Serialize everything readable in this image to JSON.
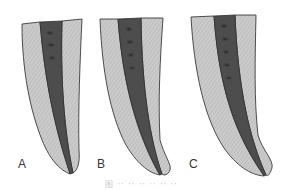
{
  "figure": {
    "panels": [
      {
        "label": "A",
        "description": "tooth root cross-section with canal"
      },
      {
        "label": "B",
        "description": "tooth root cross-section with canal"
      },
      {
        "label": "C",
        "description": "tooth root cross-section with canal"
      }
    ],
    "caption": "图 ·· ·· ·· ·· ·· ··",
    "colors": {
      "dentin": "#c9c9c9",
      "dentin_hatch": "#b3b3b3",
      "canal": "#4a4a4a",
      "canal_spots": "#2a2a2a",
      "outline": "#3a3a3a",
      "label": "#333333",
      "caption": "#c8c8c8"
    }
  }
}
